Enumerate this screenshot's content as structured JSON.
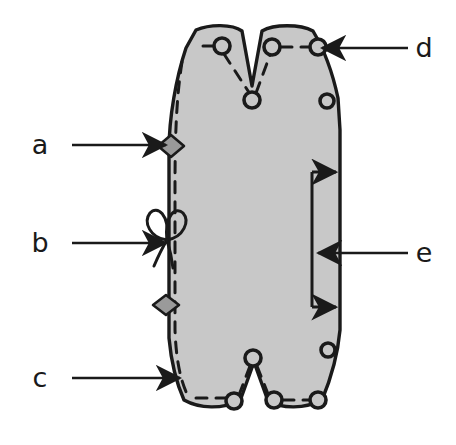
{
  "figure": {
    "type": "line-diagram",
    "canvas": {
      "width": 456,
      "height": 445
    },
    "colors": {
      "background": "#ffffff",
      "shape_fill": "#c8c8c8",
      "outline": "#1a1a1a",
      "stitch_dashed": "#1a1a1a",
      "marker_fill": "#9a9a9a",
      "label_text": "#1a1a1a"
    }
  },
  "labels": [
    {
      "id": "a",
      "text": "a",
      "x": 40,
      "y": 145,
      "side": "left",
      "points_to": "diamond-marker-upper"
    },
    {
      "id": "b",
      "text": "b",
      "x": 40,
      "y": 243,
      "side": "left",
      "points_to": "bow-knot-marker"
    },
    {
      "id": "c",
      "text": "c",
      "x": 40,
      "y": 378,
      "side": "left",
      "points_to": "lower-left-edge"
    },
    {
      "id": "d",
      "text": "d",
      "x": 424,
      "y": 48,
      "side": "right",
      "points_to": "upper-right-eyelet"
    },
    {
      "id": "e",
      "text": "e",
      "x": 424,
      "y": 253,
      "side": "right",
      "points_to": "dimension-bracket"
    }
  ],
  "leader_lines": [
    {
      "id": "leader-a",
      "from_x": 72,
      "from_y": 145,
      "to_x": 168,
      "to_y": 145,
      "arrow": "right"
    },
    {
      "id": "leader-b",
      "from_x": 72,
      "from_y": 243,
      "to_x": 168,
      "to_y": 243,
      "arrow": "right"
    },
    {
      "id": "leader-c",
      "from_x": 72,
      "from_y": 378,
      "to_x": 180,
      "to_y": 378,
      "arrow": "right"
    },
    {
      "id": "leader-d",
      "from_x": 408,
      "from_y": 48,
      "to_x": 322,
      "to_y": 48,
      "arrow": "left"
    },
    {
      "id": "leader-e",
      "from_x": 408,
      "from_y": 253,
      "to_x": 318,
      "to_y": 253,
      "arrow": "left"
    }
  ],
  "markers": [
    {
      "id": "diamond-marker-upper",
      "shape": "diamond",
      "cx": 171,
      "cy": 146,
      "rx": 13,
      "ry": 11
    },
    {
      "id": "diamond-marker-lower",
      "shape": "diamond",
      "cx": 166,
      "cy": 305,
      "rx": 13,
      "ry": 10
    },
    {
      "id": "bow-knot-marker",
      "shape": "bow-knot",
      "cx": 167,
      "cy": 240
    }
  ],
  "eyelets": [
    {
      "id": "eyelet-top-left",
      "cx": 222,
      "cy": 46,
      "r": 8
    },
    {
      "id": "eyelet-top-mid-right",
      "cx": 272,
      "cy": 47,
      "r": 8
    },
    {
      "id": "eyelet-top-right",
      "cx": 318,
      "cy": 47,
      "r": 8
    },
    {
      "id": "eyelet-notch-upper",
      "cx": 252,
      "cy": 100,
      "r": 8
    },
    {
      "id": "eyelet-right-upper",
      "cx": 327,
      "cy": 101,
      "r": 7
    },
    {
      "id": "eyelet-right-lower",
      "cx": 328,
      "cy": 350,
      "r": 7
    },
    {
      "id": "eyelet-notch-lower",
      "cx": 253,
      "cy": 358,
      "r": 8
    },
    {
      "id": "eyelet-bottom-left",
      "cx": 234,
      "cy": 401,
      "r": 8
    },
    {
      "id": "eyelet-bottom-mid",
      "cx": 274,
      "cy": 400,
      "r": 8
    },
    {
      "id": "eyelet-bottom-right",
      "cx": 318,
      "cy": 400,
      "r": 8
    }
  ],
  "dimension_bracket": {
    "id": "dimension-bracket",
    "spine_x": 312,
    "top_y": 172,
    "bottom_y": 307,
    "arm_end_x": 340,
    "arrow_direction": "right",
    "arms": 2
  },
  "accessibility": {
    "alt": "Shaded pattern piece with dashed stitch line, ten round eyelets, two diamond markers, a bow knot, and a vertical dimension bracket; callouts labeled a, b, c, d and e."
  }
}
